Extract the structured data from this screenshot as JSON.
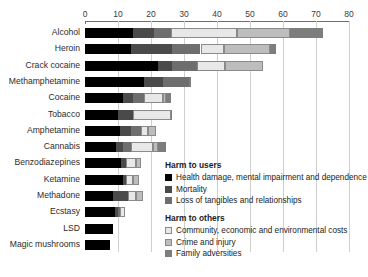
{
  "chart_data": {
    "type": "bar",
    "orientation": "horizontal",
    "stacked": true,
    "title": "",
    "xlabel": "",
    "ylabel": "",
    "xlim": [
      0,
      80
    ],
    "xticks": [
      0,
      10,
      20,
      30,
      40,
      50,
      60,
      70,
      80
    ],
    "grid": true,
    "legend_position": "inside-right",
    "categories": [
      "Alcohol",
      "Heroin",
      "Crack cocaine",
      "Methamphetamine",
      "Cocaine",
      "Tobacco",
      "Amphetamine",
      "Cannabis",
      "Benzodiazepines",
      "Ketamine",
      "Methadone",
      "Ecstasy",
      "LSD",
      "Magic mushrooms"
    ],
    "series": [
      {
        "name": "Health damage, mental impairment and dependence",
        "group": "Harm to users",
        "color": "#000000",
        "values": [
          14.5,
          14.0,
          22.0,
          18.0,
          11.5,
          10.0,
          10.5,
          9.5,
          11.0,
          11.5,
          8.5,
          9.0,
          8.5,
          7.5
        ]
      },
      {
        "name": "Mortality",
        "group": "Harm to users",
        "color": "#4a4a4a",
        "values": [
          6.5,
          12.5,
          4.5,
          5.5,
          3.0,
          4.5,
          3.5,
          2.0,
          1.5,
          1.0,
          4.5,
          1.0,
          0.0,
          0.0
        ]
      },
      {
        "name": "Loss of tangibles and relationships",
        "group": "Harm to users",
        "color": "#6e6e6e",
        "values": [
          5.0,
          8.5,
          7.5,
          8.0,
          3.5,
          0.0,
          3.0,
          2.5,
          0.0,
          0.0,
          0.0,
          0.5,
          0.0,
          0.0
        ]
      },
      {
        "name": "Community, economic and environmental costs",
        "group": "Harm to others",
        "color": "#e8e8e8",
        "values": [
          20.0,
          7.0,
          8.5,
          0.0,
          5.5,
          11.5,
          2.0,
          6.5,
          3.0,
          2.0,
          2.5,
          1.5,
          0.0,
          0.0
        ]
      },
      {
        "name": "Crime and injury",
        "group": "Harm to others",
        "color": "#bdbdbd",
        "values": [
          16.0,
          14.0,
          11.5,
          0.0,
          1.0,
          0.0,
          2.5,
          1.5,
          1.5,
          2.0,
          2.0,
          0.0,
          0.0,
          0.0
        ]
      },
      {
        "name": "Family adversities",
        "group": "Harm to others",
        "color": "#7d7d7d",
        "values": [
          10.0,
          2.0,
          0.0,
          0.5,
          1.5,
          0.5,
          0.0,
          2.5,
          0.0,
          0.0,
          0.0,
          0.0,
          0.0,
          0.0
        ]
      }
    ],
    "totals": [
      72.0,
      58.0,
      54.0,
      32.0,
      26.0,
      26.5,
      21.5,
      24.5,
      17.0,
      16.5,
      17.5,
      12.0,
      8.5,
      7.5
    ]
  },
  "legend": {
    "group_users_title": "Harm to users",
    "group_others_title": "Harm to others"
  }
}
